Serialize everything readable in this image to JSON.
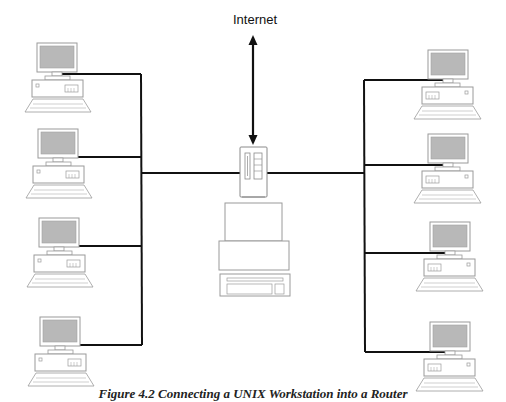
{
  "diagram": {
    "type": "network-topology",
    "internet_label": "Internet",
    "caption": "Figure 4.2 Connecting a UNIX Workstation into a Router",
    "nodes": {
      "internet": {
        "label": "Internet"
      },
      "router": {
        "icon": "router-icon"
      },
      "central_workstation": {
        "icon": "workstation-icon"
      },
      "left_clients": [
        {
          "id": "left-pc-1",
          "icon": "desktop-computer-icon"
        },
        {
          "id": "left-pc-2",
          "icon": "desktop-computer-icon"
        },
        {
          "id": "left-pc-3",
          "icon": "desktop-computer-icon"
        },
        {
          "id": "left-pc-4",
          "icon": "desktop-computer-icon"
        }
      ],
      "right_clients": [
        {
          "id": "right-pc-1",
          "icon": "desktop-computer-icon"
        },
        {
          "id": "right-pc-2",
          "icon": "desktop-computer-icon"
        },
        {
          "id": "right-pc-3",
          "icon": "desktop-computer-icon"
        },
        {
          "id": "right-pc-4",
          "icon": "desktop-computer-icon"
        }
      ]
    },
    "edges": [
      {
        "from": "internet",
        "to": "router",
        "style": "double-arrow"
      },
      {
        "from": "router",
        "to": "left-bus"
      },
      {
        "from": "router",
        "to": "right-bus"
      },
      {
        "from": "left-bus",
        "to": "left-pc-1"
      },
      {
        "from": "left-bus",
        "to": "left-pc-2"
      },
      {
        "from": "left-bus",
        "to": "left-pc-3"
      },
      {
        "from": "left-bus",
        "to": "left-pc-4"
      },
      {
        "from": "right-bus",
        "to": "right-pc-1"
      },
      {
        "from": "right-bus",
        "to": "right-pc-2"
      },
      {
        "from": "right-bus",
        "to": "right-pc-3"
      },
      {
        "from": "right-bus",
        "to": "right-pc-4"
      }
    ],
    "colors": {
      "line": "#111111",
      "outline": "#9a9a9a",
      "screen": "#b8b8b8",
      "background": "#ffffff"
    }
  }
}
